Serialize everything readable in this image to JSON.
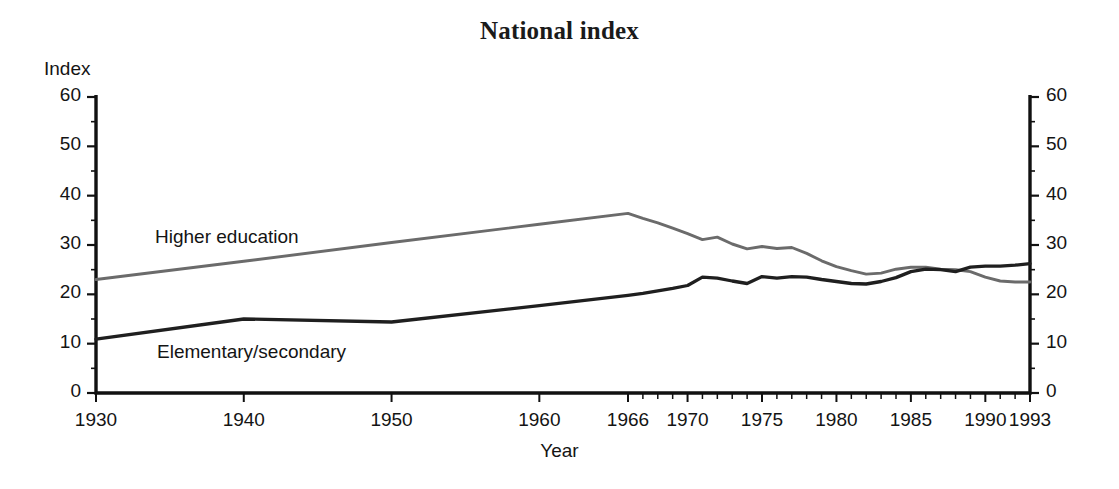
{
  "chart_data": {
    "type": "line",
    "title": "National index",
    "xlabel": "Year",
    "ylabel": "Index",
    "ylim": [
      0,
      60
    ],
    "yticks": [
      0,
      10,
      20,
      30,
      40,
      50,
      60
    ],
    "y_minor_step": 5,
    "grid": false,
    "dual_y_axis": true,
    "axis_note": "x-axis uses decade spacing 1930-1966 then annual spacing 1966-1993",
    "xticks_labeled": [
      1930,
      1940,
      1950,
      1960,
      1966,
      1970,
      1975,
      1980,
      1985,
      1990,
      1993
    ],
    "legend_position": "inline-labels",
    "series": [
      {
        "name": "Higher education",
        "color": "#6b6b6b",
        "x": [
          1930,
          1940,
          1950,
          1960,
          1966,
          1967,
          1968,
          1969,
          1970,
          1971,
          1972,
          1973,
          1974,
          1975,
          1976,
          1977,
          1978,
          1979,
          1980,
          1981,
          1982,
          1983,
          1984,
          1985,
          1986,
          1987,
          1988,
          1989,
          1990,
          1991,
          1992,
          1993
        ],
        "values": [
          23.0,
          26.7,
          30.5,
          34.2,
          36.4,
          35.4,
          34.5,
          33.4,
          32.3,
          31.1,
          31.6,
          30.2,
          29.2,
          29.7,
          29.3,
          29.5,
          28.3,
          26.8,
          25.6,
          24.8,
          24.1,
          24.3,
          25.1,
          25.5,
          25.5,
          25.1,
          25.0,
          24.6,
          23.5,
          22.7,
          22.5,
          22.5
        ]
      },
      {
        "name": "Elementary/secondary",
        "color": "#1f1f1f",
        "x": [
          1930,
          1940,
          1950,
          1960,
          1966,
          1967,
          1968,
          1969,
          1970,
          1971,
          1972,
          1973,
          1974,
          1975,
          1976,
          1977,
          1978,
          1979,
          1980,
          1981,
          1982,
          1983,
          1984,
          1985,
          1986,
          1987,
          1988,
          1989,
          1990,
          1991,
          1992,
          1993
        ],
        "values": [
          10.9,
          15.0,
          14.4,
          17.7,
          19.8,
          20.2,
          20.7,
          21.2,
          21.8,
          23.5,
          23.3,
          22.7,
          22.2,
          23.6,
          23.3,
          23.6,
          23.5,
          23.0,
          22.6,
          22.2,
          22.1,
          22.6,
          23.4,
          24.6,
          25.1,
          25.0,
          24.6,
          25.5,
          25.7,
          25.7,
          25.9,
          26.2
        ]
      }
    ]
  },
  "header": {
    "title": "National index"
  },
  "axes": {
    "y_title": "Index",
    "x_title": "Year",
    "y_tick_labels_left": [
      "60",
      "50",
      "40",
      "30",
      "20",
      "10",
      "0"
    ],
    "y_tick_labels_right": [
      "60",
      "50",
      "40",
      "30",
      "20",
      "10",
      "0"
    ],
    "x_tick_labels": [
      "1930",
      "1940",
      "1950",
      "1960",
      "1966",
      "1970",
      "1975",
      "1980",
      "1985",
      "1990",
      "1993"
    ]
  },
  "series_labels": {
    "higher": "Higher education",
    "elemsec": "Elementary/secondary"
  },
  "colors": {
    "higher_education": "#6b6b6b",
    "elementary_secondary": "#1f1f1f",
    "axis": "#111111",
    "text": "#141414",
    "background": "#ffffff"
  }
}
